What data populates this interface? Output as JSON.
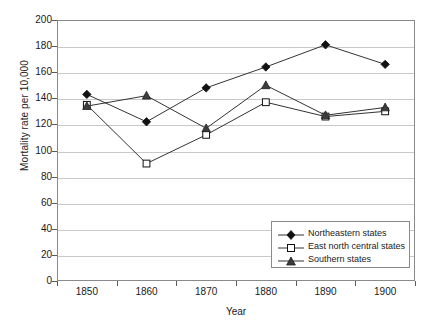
{
  "chart_data": {
    "type": "line",
    "title": "",
    "subtitle": "",
    "xlabel": "Year",
    "ylabel": "Mortality rate per 10,000",
    "categories": [
      1850,
      1860,
      1870,
      1880,
      1890,
      1900
    ],
    "x_tick_labels": [
      "1850",
      "1860",
      "1870",
      "1880",
      "1890",
      "1900"
    ],
    "y_tick_labels": [
      "0",
      "20",
      "40",
      "60",
      "80",
      "100",
      "120",
      "140",
      "160",
      "180",
      "200"
    ],
    "y_ticks": [
      0,
      20,
      40,
      60,
      80,
      100,
      120,
      140,
      160,
      180,
      200
    ],
    "xlim": [
      1845,
      1905
    ],
    "ylim": [
      0,
      200
    ],
    "grid": "horizontal",
    "legend_position": "inside-bottom-right",
    "series": [
      {
        "name": "Northeastern states",
        "marker": "filled-diamond",
        "color": "#222222",
        "values": [
          143,
          122,
          148,
          164,
          181,
          166
        ]
      },
      {
        "name": "East north central states",
        "marker": "open-square",
        "color": "#222222",
        "values": [
          135,
          90,
          112,
          137,
          126,
          130
        ]
      },
      {
        "name": "Southern states",
        "marker": "filled-triangle",
        "color": "#444444",
        "values": [
          134,
          142,
          117,
          150,
          127,
          133
        ]
      }
    ]
  },
  "legend": {
    "items": [
      {
        "label": "Northeastern states",
        "marker": "filled-diamond"
      },
      {
        "label": "East north central states",
        "marker": "open-square"
      },
      {
        "label": "Southern states",
        "marker": "filled-triangle"
      }
    ]
  },
  "axes": {
    "y_title": "Mortality rate per 10,000",
    "x_title": "Year"
  },
  "colors": {
    "plot_border": "#8a8a8a",
    "gridline": "#c9c9c9",
    "series_line": "#333333",
    "text": "#1a1a1a",
    "background": "#ffffff"
  }
}
